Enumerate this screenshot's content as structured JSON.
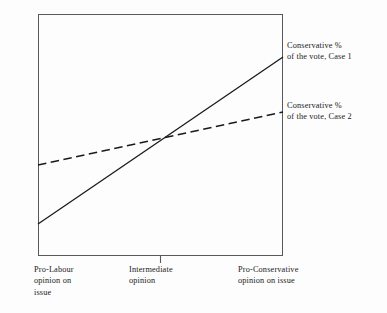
{
  "figure": {
    "background_color": "#fdfdfd",
    "ink_color": "#1a1a1a",
    "frame_color": "#555a5e"
  },
  "chart_data": {
    "type": "line",
    "title": "",
    "xlabel": "",
    "ylabel": "",
    "grid": false,
    "legend_position": "right-inline-annotation",
    "xlim": [
      0,
      1
    ],
    "ylim": [
      0,
      1
    ],
    "x_tick_labels": [
      "Pro-Labour opinion on issue",
      "Intermediate opinion",
      "Pro-Conservative opinion on issue"
    ],
    "x": [
      0,
      1
    ],
    "series": [
      {
        "name": "Conservative % of the vote, Case 1",
        "style": "solid",
        "values": [
          0.132,
          0.822
        ]
      },
      {
        "name": "Conservative % of the vote, Case 2",
        "style": "dashed",
        "values": [
          0.376,
          0.595
        ]
      }
    ],
    "annotations": [
      {
        "name": "case-1-label",
        "line1": "Conservative %",
        "line2": "of the vote, Case 1"
      },
      {
        "name": "case-2-label",
        "line1": "Conservative %",
        "line2": "of the vote, Case 2"
      }
    ]
  },
  "labels": {
    "case1": {
      "line1": "Conservative %",
      "line2": "of the vote, Case 1"
    },
    "case2": {
      "line1": "Conservative %",
      "line2": "of the vote, Case 2"
    },
    "x_left": {
      "line1": "Pro-Labour",
      "line2": "opinion on",
      "line3": "issue"
    },
    "x_center": {
      "line1": "Intermediate",
      "line2": "opinion"
    },
    "x_right": {
      "line1": "Pro-Conservative",
      "line2": "opinion on issue"
    }
  }
}
